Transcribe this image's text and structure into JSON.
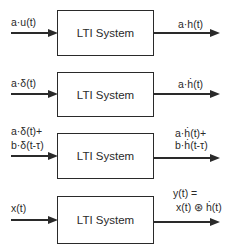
{
  "diagram": {
    "rows": [
      {
        "box_label": "LTI System",
        "input_lines": [
          "a·u(t)"
        ],
        "output_lines": [
          "a·h(t)"
        ]
      },
      {
        "box_label": "LTI System",
        "input_lines": [
          "a·δ(t)"
        ],
        "output_lines": [
          "a·ḣ(t)"
        ]
      },
      {
        "box_label": "LTI System",
        "input_lines": [
          "a·δ(t)+",
          "b·δ(t-τ)"
        ],
        "output_lines": [
          "a·ḣ(t)+",
          "b·ḣ(t-τ)"
        ]
      },
      {
        "box_label": "LTI System",
        "input_lines": [
          "x(t)"
        ],
        "output_lines": [
          "y(t) =",
          "x(t) ⊛ ḣ(t)"
        ]
      }
    ]
  }
}
